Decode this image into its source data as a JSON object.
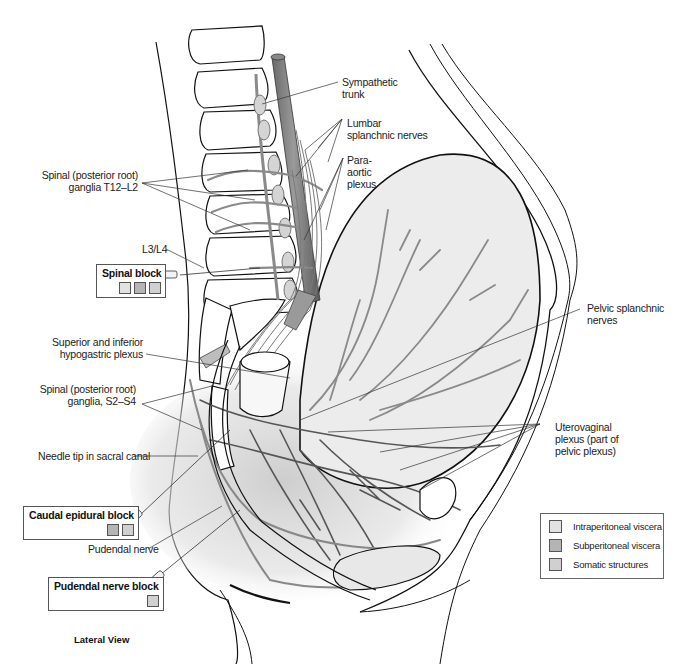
{
  "figure": {
    "caption": "Lateral View"
  },
  "colors": {
    "intraperitoneal": "#e2e2e2",
    "subperitoneal": "#b4b4b4",
    "somatic": "#d0d0d0",
    "nerve_stroke": "#7a7a7a",
    "nerve_fill": "#cfcfcf",
    "outline": "#111111",
    "uterus_fill": "#ececec"
  },
  "labels": {
    "sympathetic_trunk": [
      "Sympathetic",
      "trunk"
    ],
    "lumbar_splanchnic": [
      "Lumbar",
      "splanchnic nerves"
    ],
    "para_aortic": [
      "Para-",
      "aortic",
      "plexus"
    ],
    "spinal_ganglia_t12_l2": [
      "Spinal (posterior root)",
      "ganglia T12–L2"
    ],
    "l3_l4": "L3/L4",
    "superior_inferior_hypogastric": [
      "Superior and inferior",
      "hypogastric plexus"
    ],
    "spinal_ganglia_s2_s4": [
      "Spinal (posterior root)",
      "ganglia, S2–S4"
    ],
    "needle_tip": "Needle tip in sacral canal",
    "pudendal_nerve": "Pudendal nerve",
    "pelvic_splanchnic": [
      "Pelvic splanchnic",
      "nerves"
    ],
    "uterovaginal_plexus": [
      "Uterovaginal",
      "plexus (part of",
      "pelvic plexus)"
    ]
  },
  "blocks": [
    {
      "id": "spinal",
      "title": "Spinal block",
      "swatches": [
        "intraperitoneal",
        "subperitoneal",
        "somatic"
      ]
    },
    {
      "id": "caudal",
      "title": "Caudal epidural block",
      "swatches": [
        "subperitoneal",
        "somatic"
      ]
    },
    {
      "id": "pudendal",
      "title": "Pudendal nerve block",
      "swatches": [
        "somatic"
      ]
    }
  ],
  "legend": {
    "items": [
      {
        "key": "intraperitoneal",
        "label": "Intraperitoneal viscera"
      },
      {
        "key": "subperitoneal",
        "label": "Subperitoneal viscera"
      },
      {
        "key": "somatic",
        "label": "Somatic structures"
      }
    ]
  }
}
